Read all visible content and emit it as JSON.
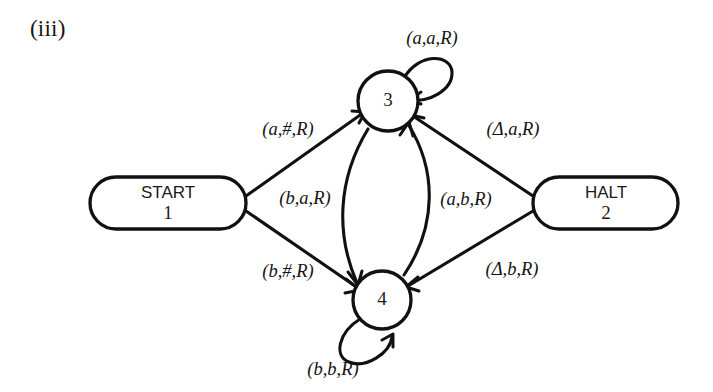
{
  "figure": {
    "label": "(iii)"
  },
  "diagram": {
    "type": "turing-machine-state-diagram",
    "blank_symbol": "Δ",
    "nodes": [
      {
        "id": "start",
        "shape": "stadium",
        "name": "START",
        "number": "1",
        "cx": 167,
        "cy": 203
      },
      {
        "id": "halt",
        "shape": "stadium",
        "name": "HALT",
        "number": "2",
        "cx": 605,
        "cy": 203
      },
      {
        "id": "s3",
        "shape": "circle",
        "name": "",
        "number": "3",
        "cx": 388,
        "cy": 101
      },
      {
        "id": "s4",
        "shape": "circle",
        "name": "",
        "number": "4",
        "cx": 382,
        "cy": 300
      }
    ],
    "edges": [
      {
        "id": "e1",
        "from": "start",
        "to": "s3",
        "label": "(a,#,R)",
        "read": "a",
        "write": "#",
        "move": "R",
        "label_x": 288,
        "label_y": 131
      },
      {
        "id": "e2",
        "from": "start",
        "to": "s4",
        "label": "(b,#,R)",
        "read": "b",
        "write": "#",
        "move": "R",
        "label_x": 288,
        "label_y": 273
      },
      {
        "id": "e3",
        "from": "s3",
        "to": "s4",
        "label": "(b,a,R)",
        "read": "b",
        "write": "a",
        "move": "R",
        "label_x": 305,
        "label_y": 200
      },
      {
        "id": "e4",
        "from": "s4",
        "to": "s3",
        "label": "(a,b,R)",
        "read": "a",
        "write": "b",
        "move": "R",
        "label_x": 466,
        "label_y": 201
      },
      {
        "id": "e5",
        "from": "halt",
        "to": "s3",
        "label": "(Δ,a,R)",
        "read": "Δ",
        "write": "a",
        "move": "R",
        "label_x": 513,
        "label_y": 131
      },
      {
        "id": "e6",
        "from": "halt",
        "to": "s4",
        "label": "(Δ,b,R)",
        "read": "Δ",
        "write": "b",
        "move": "R",
        "label_x": 512,
        "label_y": 271
      },
      {
        "id": "e7",
        "from": "s3",
        "to": "s3",
        "label": "(a,a,R)",
        "read": "a",
        "write": "a",
        "move": "R",
        "label_x": 432,
        "label_y": 40,
        "self_loop": true
      },
      {
        "id": "e8",
        "from": "s4",
        "to": "s4",
        "label": "(b,b,R)",
        "read": "b",
        "write": "b",
        "move": "R",
        "label_x": 333,
        "label_y": 371,
        "self_loop": true
      }
    ]
  }
}
